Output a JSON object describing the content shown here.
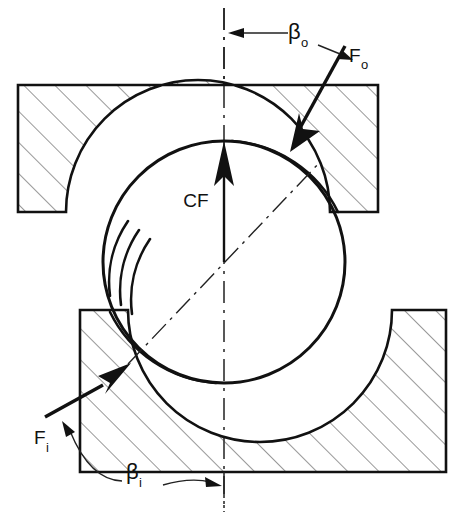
{
  "figure": {
    "background_color": "#ffffff",
    "line_color": "#111111",
    "hatch_color": "#3a3a3a"
  },
  "labels": {
    "beta_outer": {
      "base": "β",
      "sub": "o",
      "full": "βo"
    },
    "force_outer": {
      "base": "F",
      "sub": "o",
      "full": "Fo"
    },
    "centrifugal": {
      "full": "CF"
    },
    "force_inner": {
      "base": "F",
      "sub": "i",
      "full": "Fi"
    },
    "beta_inner": {
      "base": "β",
      "sub": "i",
      "full": "βi"
    }
  },
  "geometry": {
    "ball": {
      "center_x": 224,
      "center_y": 262,
      "radius": 121
    },
    "outer_race": {
      "left": 18,
      "right": 378,
      "top": 85,
      "bottom": 212
    },
    "inner_race": {
      "left": 80,
      "right": 446,
      "top": 310,
      "bottom": 472
    },
    "centerline": {
      "x": 224,
      "y_top": 8,
      "y_bottom": 510
    },
    "outer_contact_point": {
      "x": 292,
      "y": 152
    },
    "inner_contact_point": {
      "x": 128,
      "y": 364
    }
  }
}
